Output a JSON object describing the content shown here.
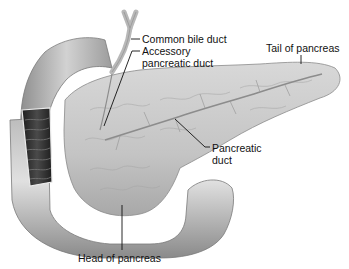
{
  "diagram": {
    "labels": {
      "common_bile_duct": "Common bile duct",
      "accessory_duct_line1": "Accessory",
      "accessory_duct_line2": "pancreatic duct",
      "tail": "Tail of pancreas",
      "pancreatic_duct_line1": "Pancreatic",
      "pancreatic_duct_line2": "duct",
      "head": "Head of pancreas"
    },
    "colors": {
      "organ_fill": "#c9c9c9",
      "organ_shade": "#9a9a9a",
      "duodenum_fill": "#bdbdbd",
      "duodenum_dark": "#2a2a2a",
      "leader_line": "#111111"
    }
  }
}
